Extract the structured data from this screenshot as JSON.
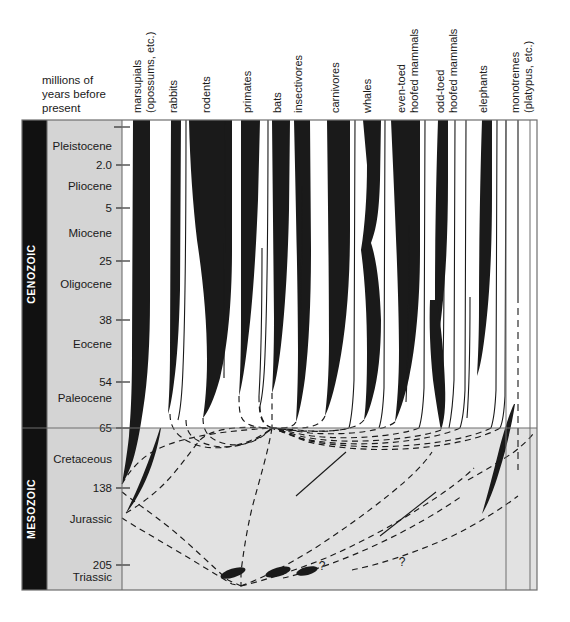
{
  "figure": {
    "axis_caption_line1": "millions of",
    "axis_caption_line2": "years before",
    "axis_caption_line3": "present",
    "colors": {
      "era_bar": "#111111",
      "epoch_panel": "#d4d4d4",
      "mesozoic_field": "#e2e2e2",
      "spindle": "#1a1a1a",
      "border": "#6e6e6e",
      "text": "#1a1a1a"
    }
  },
  "eras": [
    {
      "name": "CENOZOIC",
      "top_ma": 0,
      "bottom_ma": 65
    },
    {
      "name": "MESOZOIC",
      "top_ma": 65,
      "bottom_ma": 245
    }
  ],
  "epochs": [
    {
      "label": "Pleistocene",
      "base_ma": 2.0
    },
    {
      "label": "Pliocene",
      "base_ma": 5
    },
    {
      "label": "Miocene",
      "base_ma": 25
    },
    {
      "label": "Oligocene",
      "base_ma": 38
    },
    {
      "label": "Eocene",
      "base_ma": 54
    },
    {
      "label": "Paleocene",
      "base_ma": 65
    },
    {
      "label": "Cretaceous",
      "base_ma": 138
    },
    {
      "label": "Jurassic",
      "base_ma": 205
    },
    {
      "label": "Triassic",
      "base_ma": 245
    }
  ],
  "tick_labels": [
    "2.0",
    "5",
    "25",
    "38",
    "54",
    "65",
    "138",
    "205"
  ],
  "taxa": [
    {
      "id": "marsupials",
      "lines": [
        "marsupials",
        "(opossums, etc.)"
      ]
    },
    {
      "id": "rabbits",
      "lines": [
        "rabbits"
      ]
    },
    {
      "id": "rodents",
      "lines": [
        "rodents"
      ]
    },
    {
      "id": "primates",
      "lines": [
        "primates"
      ]
    },
    {
      "id": "bats",
      "lines": [
        "bats"
      ]
    },
    {
      "id": "insectivores",
      "lines": [
        "insectivores"
      ]
    },
    {
      "id": "carnivores",
      "lines": [
        "carnivores"
      ]
    },
    {
      "id": "whales",
      "lines": [
        "whales"
      ]
    },
    {
      "id": "even-toed-hoofed-mammals",
      "lines": [
        "even-toed",
        "hoofed mammals"
      ]
    },
    {
      "id": "odd-toed-hoofed-mammals",
      "lines": [
        "odd-toed",
        "hoofed mammals"
      ]
    },
    {
      "id": "elephants",
      "lines": [
        "elephants"
      ]
    },
    {
      "id": "monotremes",
      "lines": [
        "monotremes",
        "(platypus, etc.)"
      ]
    }
  ],
  "annotations": [
    {
      "label": "?",
      "near": "odd-toed-hoofed-mammals",
      "approx_ma": 27
    },
    {
      "label": "?",
      "near": "elephants-stem",
      "approx_ma": 212
    },
    {
      "label": "?",
      "near": "monotremes-stem",
      "approx_ma": 212
    }
  ],
  "chart_data": {
    "type": "area",
    "ylabel": "millions of years before present",
    "ylim": [
      245,
      0
    ],
    "y_scale": "piecewise-linear by epoch band",
    "grid": false,
    "legend": "none",
    "categories": [
      "marsupials",
      "rabbits",
      "rodents",
      "primates",
      "bats",
      "insectivores",
      "carnivores",
      "whales",
      "even-toed hoofed mammals",
      "odd-toed hoofed mammals",
      "elephants",
      "monotremes"
    ],
    "series": [
      {
        "name": "marsupials",
        "first_appearance_ma": 90,
        "present_width_rank": "wide",
        "x_center": 141
      },
      {
        "name": "rabbits",
        "first_appearance_ma": 57,
        "present_width_rank": "narrow",
        "x_center": 176
      },
      {
        "name": "rodents",
        "first_appearance_ma": 58,
        "present_width_rank": "widest",
        "x_center": 209
      },
      {
        "name": "primates",
        "first_appearance_ma": 62,
        "present_width_rank": "medium",
        "x_center": 250
      },
      {
        "name": "bats",
        "first_appearance_ma": 52,
        "present_width_rank": "medium",
        "x_center": 281
      },
      {
        "name": "insectivores",
        "first_appearance_ma": 70,
        "present_width_rank": "medium",
        "x_center": 301
      },
      {
        "name": "carnivores",
        "first_appearance_ma": 60,
        "present_width_rank": "wide",
        "x_center": 338
      },
      {
        "name": "whales",
        "first_appearance_ma": 52,
        "present_width_rank": "medium",
        "x_center": 370
      },
      {
        "name": "even-toed hoofed mammals",
        "first_appearance_ma": 57,
        "present_width_rank": "wide",
        "x_center": 404
      },
      {
        "name": "odd-toed hoofed mammals",
        "first_appearance_ma": 57,
        "present_width_rank": "narrow",
        "x_center": 443
      },
      {
        "name": "elephants",
        "first_appearance_ma": 58,
        "present_width_rank": "narrow",
        "x_center": 486
      },
      {
        "name": "monotremes",
        "first_appearance_ma": 130,
        "present_width_rank": "line",
        "x_center": 518
      }
    ]
  }
}
